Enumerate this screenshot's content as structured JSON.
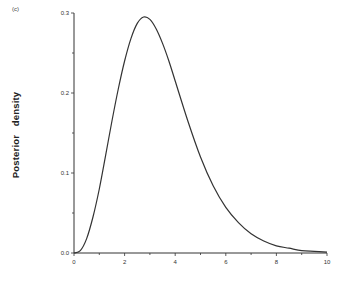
{
  "panel_label": "(c)",
  "chart_data": {
    "type": "line",
    "title": "",
    "panel": "(c)",
    "xlabel": "",
    "ylabel": "Posterior   density",
    "xlim": [
      0,
      10
    ],
    "ylim": [
      0,
      0.3
    ],
    "grid": false,
    "legend": null,
    "x_ticks": [
      "0",
      "2",
      "4",
      "6",
      "8",
      "10"
    ],
    "y_ticks": [
      "0.0",
      "0.1",
      "0.2",
      "0.3"
    ],
    "series": [
      {
        "name": "posterior density",
        "x": [
          0,
          0.25,
          0.5,
          0.75,
          1.0,
          1.25,
          1.5,
          1.75,
          2.0,
          2.25,
          2.5,
          2.75,
          3.0,
          3.25,
          3.5,
          3.75,
          4.0,
          4.5,
          5.0,
          5.5,
          6.0,
          6.5,
          7.0,
          7.5,
          8.0,
          8.5,
          9.0,
          9.5,
          10.0
        ],
        "y": [
          0.0,
          0.003,
          0.018,
          0.045,
          0.08,
          0.122,
          0.165,
          0.205,
          0.24,
          0.268,
          0.287,
          0.295,
          0.292,
          0.28,
          0.262,
          0.24,
          0.215,
          0.165,
          0.12,
          0.084,
          0.057,
          0.038,
          0.024,
          0.015,
          0.009,
          0.006,
          0.003,
          0.002,
          0.001
        ]
      }
    ]
  }
}
